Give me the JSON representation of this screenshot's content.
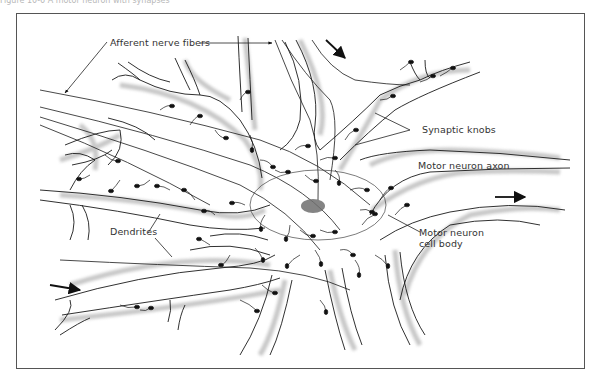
{
  "header": {
    "partial_caption": "Figure 10-6 A motor neuron with synapses"
  },
  "diagram": {
    "labels": {
      "afferent": "Afferent nerve fibers",
      "synaptic_knobs": "Synaptic knobs",
      "motor_axon": "Motor neuron axon",
      "dendrites": "Dendrites",
      "cell_body_line1": "Motor neuron",
      "cell_body_line2": "cell body"
    },
    "arrows": [
      {
        "name": "incoming-top-arrow",
        "direction": "down-right"
      },
      {
        "name": "outgoing-axon-arrow",
        "direction": "right"
      },
      {
        "name": "incoming-bottom-left-arrow",
        "direction": "right"
      }
    ],
    "colors": {
      "ink": "#1a1a1a",
      "stipple": "#9a9a9a",
      "nucleus": "#6e6e6e",
      "frame": "#555555"
    }
  }
}
